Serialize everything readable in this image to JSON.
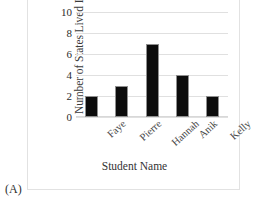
{
  "figure": {
    "panel_tag": "(A)",
    "accent_color": "#0c0c0c",
    "grid_color": "#e0e0e0"
  },
  "chart_data": {
    "type": "bar",
    "title": "",
    "xlabel": "Student Name",
    "ylabel": "Number of States Lived In",
    "categories": [
      "Faye",
      "Pierre",
      "Hannah",
      "Anik",
      "Kelly"
    ],
    "values": [
      2,
      3,
      7,
      4,
      2
    ],
    "ylim": [
      0,
      10
    ],
    "yticks": [
      0,
      2,
      4,
      6,
      8,
      10
    ],
    "ytick_labels": [
      "0",
      "2",
      "4",
      "6",
      "8",
      "10"
    ],
    "grid": true,
    "grid_axis": "y",
    "legend": false,
    "bar_color": "#0c0c0c",
    "xtick_rotation": -42
  }
}
